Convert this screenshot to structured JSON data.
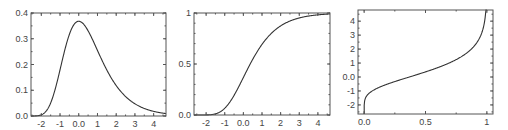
{
  "chart_data": [
    {
      "type": "line",
      "title": "",
      "xlabel": "",
      "ylabel": "",
      "description": "Gumbel probability density function",
      "xlim": [
        -2.55,
        4.66
      ],
      "ylim": [
        0.0,
        0.4
      ],
      "xticks": [
        -2,
        -1,
        0,
        1,
        2,
        3,
        4
      ],
      "xtick_labels": [
        "-2",
        "-1",
        "0.0",
        "1",
        "2",
        "3",
        "4"
      ],
      "yticks": [
        0.0,
        0.1,
        0.2,
        0.3,
        0.4
      ],
      "ytick_labels": [
        "0.0",
        "0.1",
        "0.2",
        "0.3",
        "0.4"
      ],
      "grid": false,
      "series": [
        {
          "name": "pdf",
          "x": [
            -2.5,
            -2.0,
            -1.5,
            -1.0,
            -0.5,
            0.0,
            0.5,
            1.0,
            1.5,
            2.0,
            2.5,
            3.0,
            3.5,
            4.0,
            4.5
          ],
          "y": [
            0.0,
            0.005,
            0.059,
            0.179,
            0.319,
            0.368,
            0.331,
            0.255,
            0.18,
            0.118,
            0.075,
            0.047,
            0.029,
            0.018,
            0.011
          ]
        }
      ],
      "frame": {
        "left": 31,
        "top": 13,
        "right": 166,
        "bottom": 116
      }
    },
    {
      "type": "line",
      "title": "",
      "xlabel": "",
      "ylabel": "",
      "description": "Gumbel cumulative distribution function",
      "xlim": [
        -2.65,
        4.65
      ],
      "ylim": [
        0.0,
        1.0
      ],
      "xticks": [
        -2,
        -1,
        0,
        1,
        2,
        3,
        4
      ],
      "xtick_labels": [
        "-2",
        "-1",
        "0.0",
        "1",
        "2",
        "3",
        "4"
      ],
      "yticks": [
        0.0,
        0.5,
        1.0
      ],
      "ytick_labels": [
        "0.0",
        "0.5",
        "1"
      ],
      "grid": false,
      "series": [
        {
          "name": "cdf",
          "x": [
            -2.5,
            -2.0,
            -1.5,
            -1.0,
            -0.5,
            0.0,
            0.5,
            1.0,
            1.5,
            2.0,
            2.5,
            3.0,
            3.5,
            4.0,
            4.5
          ],
          "y": [
            0.0,
            0.001,
            0.011,
            0.066,
            0.192,
            0.368,
            0.545,
            0.692,
            0.8,
            0.873,
            0.921,
            0.951,
            0.97,
            0.982,
            0.989
          ]
        }
      ],
      "frame": {
        "left": 194,
        "top": 13,
        "right": 330,
        "bottom": 115
      }
    },
    {
      "type": "line",
      "title": "",
      "xlabel": "",
      "ylabel": "",
      "description": "Gumbel quantile function",
      "xlim": [
        -0.05,
        1.05
      ],
      "ylim": [
        -2.65,
        4.8
      ],
      "xticks": [
        0.0,
        0.5,
        1.0
      ],
      "xtick_labels": [
        "0.0",
        "0.5",
        "1"
      ],
      "yticks": [
        -2,
        -1,
        0,
        1,
        2,
        3,
        4
      ],
      "ytick_labels": [
        "-2",
        "-1",
        "0.0",
        "1",
        "2",
        "3",
        "4"
      ],
      "grid": false,
      "series": [
        {
          "name": "quantile",
          "x": [
            0.0,
            0.01,
            0.05,
            0.1,
            0.2,
            0.3,
            0.4,
            0.5,
            0.6,
            0.7,
            0.8,
            0.9,
            0.95,
            0.99
          ],
          "y": [
            -2.65,
            -1.53,
            -1.1,
            -0.83,
            -0.48,
            -0.19,
            0.09,
            0.37,
            0.67,
            1.03,
            1.5,
            2.25,
            2.97,
            4.6
          ]
        }
      ],
      "frame": {
        "left": 358,
        "top": 10,
        "right": 493,
        "bottom": 114
      }
    }
  ]
}
